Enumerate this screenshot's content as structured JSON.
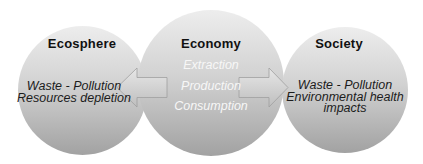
{
  "diagram": {
    "nodes": [
      {
        "id": "ecosphere",
        "label": "Ecosphere",
        "lines": [
          "Waste - Pollution",
          "Resources depletion"
        ]
      },
      {
        "id": "economy",
        "label": "Economy",
        "lines": [
          "Extraction",
          "Production",
          "Consumption"
        ]
      },
      {
        "id": "society",
        "label": "Society",
        "lines": [
          "Waste - Pollution",
          "Environmental health",
          "impacts"
        ]
      }
    ],
    "arrows": [
      {
        "from": "economy",
        "to": "ecosphere",
        "direction": "left"
      },
      {
        "from": "economy",
        "to": "society",
        "direction": "right"
      }
    ],
    "colors": {
      "background": "#ffffff",
      "circle_top": "#ededed",
      "circle_bottom": "#a2a2a2",
      "arrow_top": "#e8e8e8",
      "arrow_bottom": "#c0c0c0",
      "arrow_outline": "#9f9f9f",
      "heading_text": "#111111",
      "dark_text": "#1c1c1c",
      "light_text": "#f7f7f7"
    }
  }
}
